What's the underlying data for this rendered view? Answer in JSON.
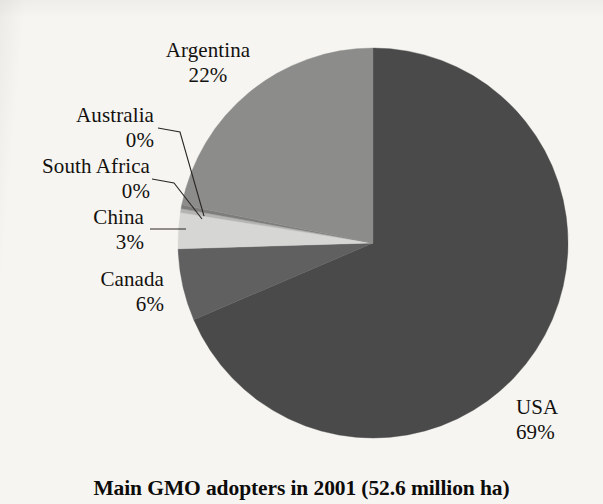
{
  "chart_data": {
    "type": "pie",
    "title": "Main GMO adopters in 2001 (52.6 million ha)",
    "total_label": "52.6 million ha",
    "year": "2001",
    "xlabel": "",
    "ylabel": "",
    "legend_position": "none",
    "grid": false,
    "start_angle_deg": 0,
    "direction": "clockwise",
    "categories": [
      "USA",
      "Canada",
      "China",
      "South Africa",
      "Australia",
      "Argentina"
    ],
    "values": [
      69,
      6,
      3,
      0,
      0,
      22
    ],
    "value_suffix": "%",
    "slices": [
      {
        "name": "USA",
        "value": 69,
        "value_label": "69%",
        "color": "#4a4a4a",
        "label_align": "left",
        "leader_line": false
      },
      {
        "name": "Canada",
        "value": 6,
        "value_label": "6%",
        "color": "#606060",
        "label_align": "right",
        "leader_line": false
      },
      {
        "name": "China",
        "value": 3,
        "value_label": "3%",
        "color": "#d6d6d4",
        "label_align": "right",
        "leader_line": true
      },
      {
        "name": "South Africa",
        "value": 0,
        "value_label": "0%",
        "color": "#b4b4b2",
        "label_align": "right",
        "leader_line": true
      },
      {
        "name": "Australia",
        "value": 0,
        "value_label": "0%",
        "color": "#7d7d7b",
        "label_align": "right",
        "leader_line": true
      },
      {
        "name": "Argentina",
        "value": 22,
        "value_label": "22%",
        "color": "#8c8c8a",
        "label_align": "center",
        "leader_line": false
      }
    ],
    "colors": {
      "background": "#f6f5f1",
      "text": "#13110f",
      "leader_line": "#2a2724",
      "usa": "#4a4a4a",
      "canada": "#606060",
      "china": "#d6d6d4",
      "south_africa": "#b4b4b2",
      "australia": "#7d7d7b",
      "argentina": "#8c8c8a"
    }
  }
}
